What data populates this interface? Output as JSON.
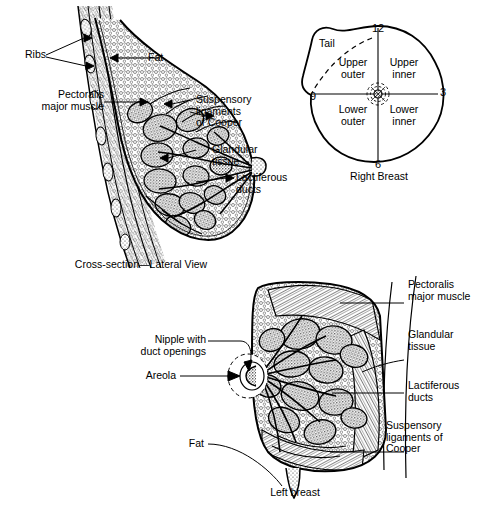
{
  "figure": {
    "background_color": "#ffffff",
    "ink_color": "#000000"
  },
  "panels": {
    "lateral": {
      "caption": "Cross-section—Lateral View",
      "labels": {
        "ribs": "Ribs",
        "fat": "Fat",
        "pectoralis": "Pectoralis\nmajor muscle",
        "suspensory": "Suspensory\nligaments\nof Cooper",
        "glandular": "Glandular\ntissue",
        "lactiferous": "Lactiferous\nducts"
      }
    },
    "quadrants": {
      "caption": "Right Breast",
      "clock": {
        "twelve": "12",
        "three": "3",
        "six": "6",
        "nine": "9"
      },
      "regions": {
        "tail": "Tail",
        "upper_outer": "Upper\nouter",
        "upper_inner": "Upper\ninner",
        "lower_outer": "Lower\nouter",
        "lower_inner": "Lower\ninner"
      }
    },
    "anterior": {
      "caption": "Left breast",
      "labels": {
        "pectoralis": "Pectoralis\nmajor muscle",
        "glandular": "Glandular\ntissue",
        "lactiferous": "Lactiferous\nducts",
        "suspensory": "Suspensory\nligaments of\nCooper",
        "nipple": "Nipple with\nduct openings",
        "areola": "Areola",
        "fat": "Fat"
      }
    }
  }
}
